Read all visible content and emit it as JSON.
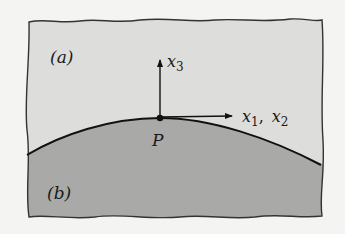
{
  "diagram": {
    "regions": [
      {
        "id": "a",
        "label": "(a)",
        "color": "#dddddc"
      },
      {
        "id": "b",
        "label": "(b)",
        "color": "#a9a9a8"
      }
    ],
    "interface": {
      "point_label": "P",
      "line_color": "#111111"
    },
    "axes": [
      {
        "name": "x3",
        "base": "x",
        "sub": "3",
        "direction": "normal (up)"
      },
      {
        "name": "x1, x2",
        "base1": "x",
        "sub1": "1",
        "sep": ",",
        "base2": "x",
        "sub2": "2",
        "direction": "tangent (right)"
      }
    ],
    "border_color": "#333333",
    "background": "#f4f4f2"
  }
}
